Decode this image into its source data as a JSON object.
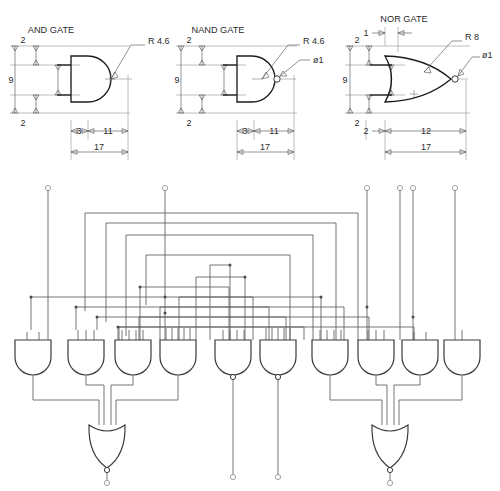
{
  "sheet": {
    "title": "Logic gate dimensioned drawings and gate array schematic",
    "background": "#ffffff",
    "line_color": "#1c1c1c",
    "wire_color": "#5d5d5d",
    "dim_color": "#4a4a4a"
  },
  "gate_details": [
    {
      "id": "and-gate",
      "label": "AND GATE",
      "radius_note": "R 4.6",
      "bubble_note": "",
      "dims": {
        "top_lead_offset": "2",
        "body_height": "9",
        "bottom_lead_offset": "2",
        "lead_length": "3",
        "body_length": "11",
        "overall": "17"
      }
    },
    {
      "id": "nand-gate",
      "label": "NAND GATE",
      "radius_note": "R 4.6",
      "bubble_note": "ø1",
      "dims": {
        "top_lead_offset": "2",
        "body_height": "9",
        "bottom_lead_offset": "2",
        "lead_length": "3",
        "body_length": "11",
        "overall": "17"
      }
    },
    {
      "id": "nor-gate",
      "label": "NOR GATE",
      "radius_note": "R 8",
      "bubble_note": "ø1",
      "dims": {
        "top_gap": "1",
        "top_lead_offset": "2",
        "body_height": "9",
        "bottom_lead_offset": "2",
        "lead_length": "2",
        "body_length": "12",
        "overall": "17"
      }
    }
  ],
  "schematic": {
    "input_terminals": [
      {
        "name": "input-terminal-1",
        "x": 48
      },
      {
        "name": "input-terminal-2",
        "x": 165
      },
      {
        "name": "input-terminal-3",
        "x": 367
      },
      {
        "name": "input-terminal-4",
        "x": 400
      },
      {
        "name": "input-terminal-5",
        "x": 413
      },
      {
        "name": "input-terminal-6",
        "x": 455
      }
    ],
    "array_gates": [
      {
        "name": "array-gate-1",
        "type": "AND",
        "inputs": 2,
        "cx": 33
      },
      {
        "name": "array-gate-2",
        "type": "AND",
        "inputs": 3,
        "cx": 86
      },
      {
        "name": "array-gate-3",
        "type": "AND",
        "inputs": 4,
        "cx": 133
      },
      {
        "name": "array-gate-4",
        "type": "AND",
        "inputs": 5,
        "cx": 178
      },
      {
        "name": "array-gate-5",
        "type": "NAND",
        "inputs": 4,
        "cx": 233
      },
      {
        "name": "array-gate-6",
        "type": "NAND",
        "inputs": 5,
        "cx": 278
      },
      {
        "name": "array-gate-7",
        "type": "AND",
        "inputs": 4,
        "cx": 330
      },
      {
        "name": "array-gate-8",
        "type": "AND",
        "inputs": 3,
        "cx": 376
      },
      {
        "name": "array-gate-9",
        "type": "AND",
        "inputs": 2,
        "cx": 420
      },
      {
        "name": "array-gate-10",
        "type": "AND",
        "inputs": 1,
        "cx": 462
      }
    ],
    "output_gates": [
      {
        "name": "output-nor-left",
        "type": "NOR",
        "cx": 107,
        "inputs": 4
      },
      {
        "name": "output-nor-right",
        "type": "NOR",
        "cx": 390,
        "inputs": 4
      }
    ],
    "output_terminals": [
      {
        "name": "output-terminal-left",
        "x": 107
      },
      {
        "name": "output-terminal-right",
        "x": 390
      },
      {
        "name": "passthrough-terminal-1",
        "x": 233
      },
      {
        "name": "passthrough-terminal-2",
        "x": 278
      }
    ]
  }
}
